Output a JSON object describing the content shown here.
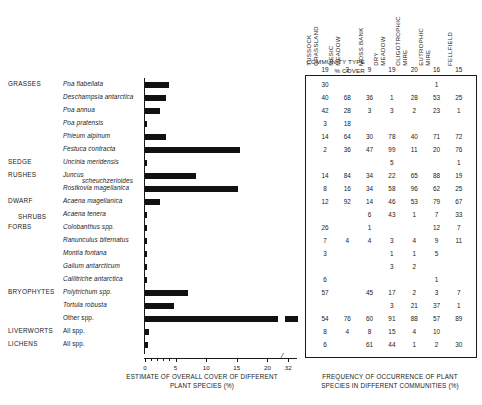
{
  "chart_data": {
    "type": "bar",
    "title": "",
    "xlabel": "ESTIMATE OF OVERALL COVER OF DIFFERENT PLANT SPECIES (%)",
    "ylabel": "",
    "xlim": [
      0,
      32
    ],
    "xticks": [
      0,
      5,
      10,
      15,
      20,
      32
    ],
    "xtick_labels": [
      "0",
      "5",
      "10",
      "15",
      "20",
      "32"
    ],
    "axis_break_between": [
      20,
      32
    ],
    "grid": false,
    "orientation": "horizontal",
    "categories": [
      "Poa flabellata",
      "Deschampsia antarctica",
      "Poa annua",
      "Poa pratensis",
      "Phleum alpinum",
      "Festuca contracta",
      "Uncinia meridensis",
      "Juncus scheuchzerioides",
      "Rostkovia magellanica",
      "Acaena magellanica",
      "Acaena tenera",
      "Colobanthus spp.",
      "Ranunculus biternatus",
      "Montia fontana",
      "Galium antarcticum",
      "Callitriche antarctica",
      "Polytrichum spp.",
      "Tortula robusta",
      "Other spp.",
      "All spp.",
      "All spp."
    ],
    "values": [
      4.0,
      3.5,
      2.4,
      0.35,
      3.5,
      15.5,
      0.35,
      8.4,
      15.2,
      2.4,
      0.4,
      0.35,
      0.3,
      0.3,
      0.3,
      0.3,
      7.0,
      4.7,
      32.0,
      0.6,
      0.5
    ],
    "series": [
      {
        "name": "Estimate of overall cover (%)",
        "values": [
          4.0,
          3.5,
          2.4,
          0.35,
          3.5,
          15.5,
          0.35,
          8.4,
          15.2,
          2.4,
          0.4,
          0.35,
          0.3,
          0.3,
          0.3,
          0.3,
          7.0,
          4.7,
          32.0,
          0.6,
          0.5
        ]
      }
    ]
  },
  "groups": [
    {
      "name": "GRASSES",
      "row": 0
    },
    {
      "name": "SEDGE",
      "row": 6
    },
    {
      "name": "RUSHES",
      "row": 7
    },
    {
      "name": "DWARF",
      "row": 9
    },
    {
      "name": "SHRUBS",
      "row": 10
    },
    {
      "name": "FORBS",
      "row": 11
    },
    {
      "name": "BRYOPHYTES",
      "row": 16
    },
    {
      "name": "LIVERWORTS",
      "row": 19
    },
    {
      "name": "LICHENS",
      "row": 20
    }
  ],
  "species_rows": [
    {
      "label": "Poa flabellata",
      "italic": true
    },
    {
      "label": "Deschampsia antarctica",
      "italic": true
    },
    {
      "label": "Poa annua",
      "italic": true
    },
    {
      "label": "Poa pratensis",
      "italic": true
    },
    {
      "label": "Phleum alpinum",
      "italic": true
    },
    {
      "label": "Festuca contracta",
      "italic": true
    },
    {
      "label": "Uncinia meridensis",
      "italic": true
    },
    {
      "label": "Juncus",
      "label2": "scheuchzerioides",
      "italic": true
    },
    {
      "label": "Rostkovia magellanica",
      "italic": true
    },
    {
      "label": "Acaena magellanica",
      "italic": true
    },
    {
      "label": "Acaena tenera",
      "italic": true
    },
    {
      "label": "Colobanthus spp.",
      "italic": true
    },
    {
      "label": "Ranunculus biternatus",
      "italic": true
    },
    {
      "label": "Montia fontana",
      "italic": true
    },
    {
      "label": "Galium antarcticum",
      "italic": true
    },
    {
      "label": "Callitriche antarctica",
      "italic": true
    },
    {
      "label": "Polytrichum spp.",
      "italic": true
    },
    {
      "label": "Tortula robusta",
      "italic": true
    },
    {
      "label": "Other spp.",
      "italic": false
    },
    {
      "label": "All spp.",
      "italic": false
    },
    {
      "label": "All spp.",
      "italic": false
    }
  ],
  "table": {
    "row_header_line1": "COMMUNITY TYPE",
    "row_header_line2": "% COVER",
    "caption": "FREQUENCY OF OCCURRENCE OF PLANT\nSPECIES IN DIFFERENT COMMUNITIES (%)",
    "columns": [
      {
        "name": "TUSSOCK\nGRASSLAND",
        "cover": "19"
      },
      {
        "name": "MESIC\nMEADOW",
        "cover": "3"
      },
      {
        "name": "MOSS BANK",
        "cover": "9"
      },
      {
        "name": "DRY\nMEADOW",
        "cover": "19"
      },
      {
        "name": "OLIGOTROPHIC\nMIRE",
        "cover": "20"
      },
      {
        "name": "EUTROPHIC\nMIRE",
        "cover": "16"
      },
      {
        "name": "FELLFIELD",
        "cover": "15"
      }
    ],
    "rows": [
      [
        "30",
        "",
        "",
        "",
        "",
        "1",
        ""
      ],
      [
        "40",
        "68",
        "36",
        "1",
        "28",
        "53",
        "25"
      ],
      [
        "42",
        "28",
        "3",
        "3",
        "2",
        "23",
        "1"
      ],
      [
        "3",
        "18",
        "",
        "",
        "",
        "",
        ""
      ],
      [
        "14",
        "64",
        "30",
        "78",
        "40",
        "71",
        "72"
      ],
      [
        "2",
        "36",
        "47",
        "99",
        "11",
        "20",
        "76"
      ],
      [
        "",
        "",
        "",
        "5",
        "",
        "",
        "1"
      ],
      [
        "14",
        "84",
        "34",
        "22",
        "65",
        "88",
        "19"
      ],
      [
        "8",
        "16",
        "34",
        "58",
        "96",
        "62",
        "25"
      ],
      [
        "12",
        "92",
        "14",
        "46",
        "53",
        "79",
        "67"
      ],
      [
        "",
        "",
        "6",
        "43",
        "1",
        "7",
        "33"
      ],
      [
        "26",
        "",
        "1",
        "",
        "",
        "12",
        "7"
      ],
      [
        "7",
        "4",
        "4",
        "3",
        "4",
        "9",
        "11"
      ],
      [
        "3",
        "",
        "",
        "1",
        "1",
        "5",
        ""
      ],
      [
        "",
        "",
        "",
        "3",
        "2",
        "",
        ""
      ],
      [
        "6",
        "",
        "",
        "",
        "",
        "1",
        ""
      ],
      [
        "57",
        "",
        "45",
        "17",
        "2",
        "3",
        "7"
      ],
      [
        "",
        "",
        "",
        "3",
        "21",
        "37",
        "1"
      ],
      [
        "54",
        "76",
        "60",
        "91",
        "88",
        "57",
        "89"
      ],
      [
        "8",
        "4",
        "8",
        "15",
        "4",
        "10",
        ""
      ],
      [
        "6",
        "",
        "61",
        "44",
        "1",
        "2",
        "30"
      ]
    ]
  },
  "colors": {
    "bar": "#111111",
    "axis": "#1a1a1a",
    "text": "#1a1a1a",
    "background": "#ffffff"
  }
}
